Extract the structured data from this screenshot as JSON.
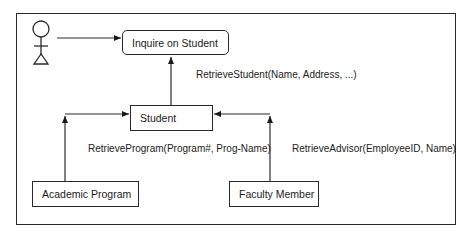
{
  "diagram": {
    "type": "context-diagram",
    "actor": {
      "name": "user-actor"
    },
    "nodes": {
      "inquire": {
        "label": "Inquire on Student"
      },
      "student": {
        "label": "Student"
      },
      "academic_program": {
        "label": "Academic Program"
      },
      "faculty_member": {
        "label": "Faculty Member"
      }
    },
    "edges": {
      "actor_to_inquire": {
        "label": ""
      },
      "student_to_inquire": {
        "label": "RetrieveStudent(Name, Address, ...)"
      },
      "program_to_student": {
        "label": "RetrieveProgram(Program#, Prog-Name)"
      },
      "faculty_to_student": {
        "label": "RetrieveAdvisor(EmployeeID, Name)"
      }
    }
  }
}
